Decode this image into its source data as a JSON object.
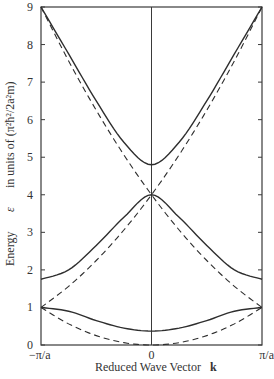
{
  "chart_data": {
    "type": "line",
    "title": "",
    "xlabel": "Reduced Wave Vector",
    "xlabel_symbol": "k",
    "ylabel": "Energy",
    "ylabel_symbol": "ε",
    "ylabel_units": "in units of (π²ħ²/2a²m)",
    "x_tick_labels": [
      "−π/a",
      "0",
      "π/a"
    ],
    "x_ticks": [
      -1,
      0,
      1
    ],
    "y_ticks": [
      0,
      1,
      2,
      3,
      4,
      5,
      6,
      7,
      8,
      9
    ],
    "y_tick_labels": [
      "0",
      "1",
      "2",
      "3",
      "4",
      "5",
      "6",
      "7",
      "8",
      "9"
    ],
    "xlim": [
      -1,
      1
    ],
    "ylim": [
      0,
      9
    ],
    "grid": false,
    "legend": "none",
    "x_units_note": "k in units of π/a",
    "series": [
      {
        "name": "Free-electron parabola ε = k²",
        "style": "dashed",
        "x": [
          -1,
          -0.75,
          -0.5,
          -0.25,
          0,
          0.25,
          0.5,
          0.75,
          1
        ],
        "values": [
          1,
          0.5625,
          0.25,
          0.0625,
          0,
          0.0625,
          0.25,
          0.5625,
          1
        ]
      },
      {
        "name": "Free-electron parabola ε = (k+2)²",
        "style": "dashed",
        "x": [
          -1,
          -0.75,
          -0.5,
          -0.25,
          0,
          0.25,
          0.5,
          0.75,
          1
        ],
        "values": [
          1,
          1.5625,
          2.25,
          3.0625,
          4,
          5.0625,
          6.25,
          7.5625,
          9
        ]
      },
      {
        "name": "Free-electron parabola ε = (k−2)²",
        "style": "dashed",
        "x": [
          -1,
          -0.75,
          -0.5,
          -0.25,
          0,
          0.25,
          0.5,
          0.75,
          1
        ],
        "values": [
          9,
          7.5625,
          6.25,
          5.0625,
          4,
          3.0625,
          2.25,
          1.5625,
          1
        ]
      },
      {
        "name": "Band 1",
        "style": "solid",
        "x": [
          -1,
          -0.75,
          -0.5,
          -0.25,
          0,
          0.25,
          0.5,
          0.75,
          1
        ],
        "values": [
          1.0,
          0.9,
          0.65,
          0.45,
          0.37,
          0.45,
          0.65,
          0.9,
          1.0
        ]
      },
      {
        "name": "Band 2",
        "style": "solid",
        "x": [
          -1,
          -0.75,
          -0.5,
          -0.25,
          0,
          0.25,
          0.5,
          0.75,
          1
        ],
        "values": [
          1.75,
          2.0,
          2.65,
          3.4,
          4.0,
          3.4,
          2.65,
          2.0,
          1.75
        ]
      },
      {
        "name": "Band 3",
        "style": "solid",
        "x": [
          -1,
          -0.75,
          -0.5,
          -0.25,
          0,
          0.25,
          0.5,
          0.75,
          1
        ],
        "values": [
          9.0,
          7.75,
          6.5,
          5.4,
          4.8,
          5.4,
          6.5,
          7.75,
          9.0
        ]
      }
    ]
  }
}
